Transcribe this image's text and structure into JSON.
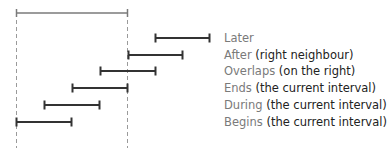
{
  "diagram": {
    "colors": {
      "reference_interval": "#7a7a7a",
      "relation_interval": "#333333",
      "guide_line": "#9a9a9a",
      "keyword_text": "#7a7a7a",
      "detail_text": "#222222"
    },
    "reference_interval": {
      "x1": 16,
      "x2": 127,
      "y": 13
    },
    "relations": [
      {
        "keyword": "Later",
        "detail": "",
        "x1": 155,
        "x2": 209,
        "y": 38
      },
      {
        "keyword": "After",
        "detail": "(right neighbour)",
        "x1": 128,
        "x2": 182,
        "y": 55
      },
      {
        "keyword": "Overlaps",
        "detail": "(on the right)",
        "x1": 100,
        "x2": 155,
        "y": 71
      },
      {
        "keyword": "Ends",
        "detail": "(the current interval)",
        "x1": 72,
        "x2": 127,
        "y": 88
      },
      {
        "keyword": "During",
        "detail": "(the current interval)",
        "x1": 44,
        "x2": 99,
        "y": 105
      },
      {
        "keyword": "Begins",
        "detail": "(the current interval)",
        "x1": 16,
        "x2": 71,
        "y": 122
      }
    ]
  }
}
